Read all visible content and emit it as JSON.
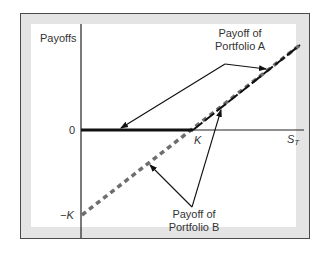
{
  "diagram": {
    "y_axis_label": "Payoffs",
    "x_axis_label_main": "S",
    "x_axis_label_sub": "T",
    "tick_zero": "0",
    "tick_k_x": "K",
    "tick_neg_k_y": "−K",
    "annotation_a_line1": "Payoff of",
    "annotation_a_line2": "Portfolio A",
    "annotation_b_line1": "Payoff of",
    "annotation_b_line2": "Portfolio B",
    "colors": {
      "frame_border": "#4a4a4a",
      "frame_fill": "#e4e4e4",
      "axis": "#222222",
      "portfolio_a_line": "#111111",
      "portfolio_b_dashed": "#6e6e6e"
    }
  }
}
